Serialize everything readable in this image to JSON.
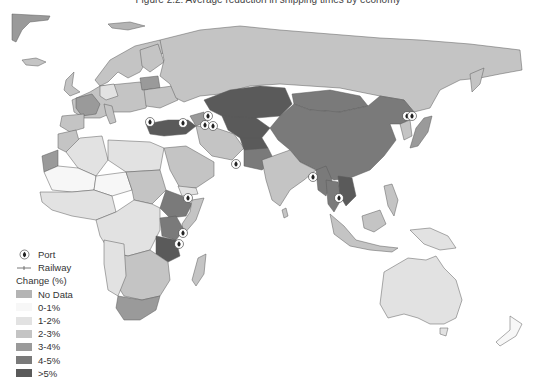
{
  "figure": {
    "title": "Figure 2.2: Average reduction in shipping times by economy"
  },
  "legend": {
    "port_label": "Port",
    "railway_label": "Railway",
    "change_header": "Change (%)",
    "classes": [
      {
        "label": "No Data",
        "color": "#b4b4b4"
      },
      {
        "label": "0-1%",
        "color": "#f7f7f7"
      },
      {
        "label": "1-2%",
        "color": "#e2e2e2"
      },
      {
        "label": "2-3%",
        "color": "#c4c4c4"
      },
      {
        "label": "3-4%",
        "color": "#9a9a9a"
      },
      {
        "label": "4-5%",
        "color": "#7a7a7a"
      },
      {
        "label": ">5%",
        "color": "#5a5a5a"
      }
    ]
  },
  "regions": [
    {
      "name": "Russia",
      "class": "2-3%"
    },
    {
      "name": "Kazakhstan",
      "class": ">5%"
    },
    {
      "name": "China",
      "class": "4-5%"
    },
    {
      "name": "Mongolia",
      "class": "4-5%"
    },
    {
      "name": "Turkey",
      "class": ">5%"
    },
    {
      "name": "Iran",
      "class": "2-3%"
    },
    {
      "name": "Pakistan",
      "class": "4-5%"
    },
    {
      "name": "Afghanistan",
      "class": ">5%"
    },
    {
      "name": "India",
      "class": "2-3%"
    },
    {
      "name": "Myanmar",
      "class": "4-5%"
    },
    {
      "name": "Thailand",
      "class": "4-5%"
    },
    {
      "name": "Cambodia/Laos/Vietnam",
      "class": ">5%"
    },
    {
      "name": "Ethiopia",
      "class": "4-5%"
    },
    {
      "name": "Kenya",
      "class": "4-5%"
    },
    {
      "name": "Tanzania",
      "class": ">5%"
    },
    {
      "name": "South Africa",
      "class": "3-4%"
    },
    {
      "name": "Madagascar",
      "class": "2-3%"
    },
    {
      "name": "Australia",
      "class": "1-2%"
    },
    {
      "name": "Japan",
      "class": "3-4%"
    },
    {
      "name": "Belarus",
      "class": "3-4%"
    },
    {
      "name": "Western Sahara",
      "class": "3-4%"
    },
    {
      "name": "Saudi Arabia",
      "class": "2-3%"
    },
    {
      "name": "Algeria",
      "class": "1-2%"
    },
    {
      "name": "Mali",
      "class": "0-1%"
    },
    {
      "name": "Europe (general)",
      "class": "2-3%"
    },
    {
      "name": "West/Central Africa",
      "class": "1-2%"
    },
    {
      "name": "Sudan",
      "class": "2-3%"
    },
    {
      "name": "Indonesia",
      "class": "2-3%"
    },
    {
      "name": "Papua New Guinea",
      "class": "1-2%"
    },
    {
      "name": "Greenland",
      "class": "3-4%"
    }
  ],
  "ports": [
    {
      "name": "Piraeus/Istanbul"
    },
    {
      "name": "Black Sea (Samsun)"
    },
    {
      "name": "Caspian North (Aktau)"
    },
    {
      "name": "Caspian (Baku)"
    },
    {
      "name": "Caspian (Turkmenbashi)"
    },
    {
      "name": "Gwadar"
    },
    {
      "name": "Djibouti"
    },
    {
      "name": "Mombasa"
    },
    {
      "name": "Dar es Salaam"
    },
    {
      "name": "Kyaukpyu"
    },
    {
      "name": "Sihanoukville"
    },
    {
      "name": "Vladivostok"
    },
    {
      "name": "Zarubino"
    }
  ]
}
